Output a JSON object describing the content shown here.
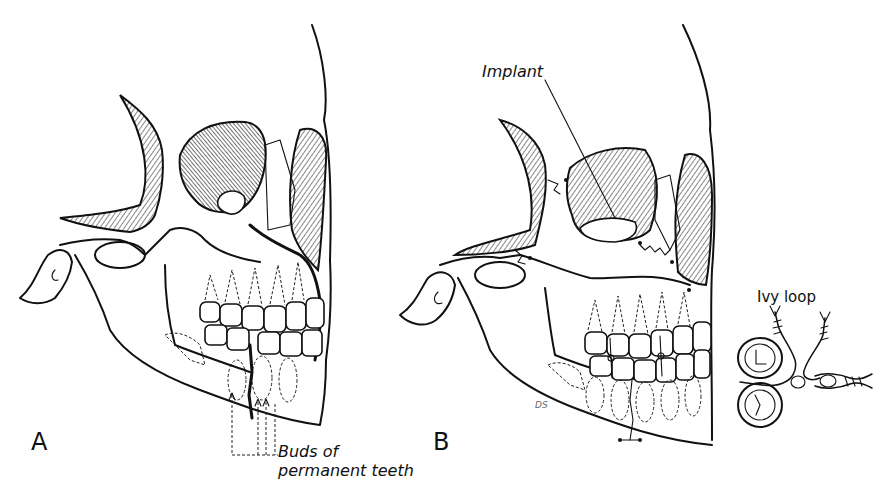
{
  "figure": {
    "panels": [
      {
        "id": "A",
        "label": "A"
      },
      {
        "id": "B",
        "label": "B"
      }
    ],
    "annotations": {
      "buds_line1": "Buds of",
      "buds_line2": "permanent teeth",
      "implant": "Implant",
      "ivy_loop": "Ivy loop"
    },
    "signature": "DS",
    "colors": {
      "ink": "#111111",
      "background": "#ffffff"
    }
  }
}
